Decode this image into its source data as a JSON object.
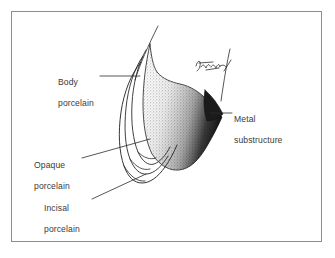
{
  "figure": {
    "type": "anatomical-line-illustration",
    "background_color": "#ffffff",
    "frame_color": "#8d8d8d",
    "ink_color": "#2b2b2b",
    "label_color": "#3a3a3a",
    "stipple_color": "#9a9a9a",
    "shadow_color": "#1c1c1c"
  },
  "labels": [
    {
      "id": "body-porcelain",
      "text": "Body\nporcelain",
      "line1": "Body",
      "line2": "porcelain",
      "position": "upper-left",
      "leader": "horizontal-right"
    },
    {
      "id": "opaque-porcelain",
      "text": "Opaque\nporcelain",
      "line1": "Opaque",
      "line2": "porcelain",
      "position": "mid-left",
      "leader": "diagonal-up-right"
    },
    {
      "id": "incisal-porcelain",
      "text": "Incisal\nporcelain",
      "line1": "Incisal",
      "line2": "porcelain",
      "position": "lower-left",
      "leader": "diagonal-up-right"
    },
    {
      "id": "metal-substructure",
      "text": "Metal\nsubstructure",
      "line1": "Metal",
      "line2": "substructure",
      "position": "right",
      "leader": "horizontal-left"
    }
  ],
  "signature": {
    "present": true,
    "description": "cursive artist signature",
    "legible": false
  }
}
